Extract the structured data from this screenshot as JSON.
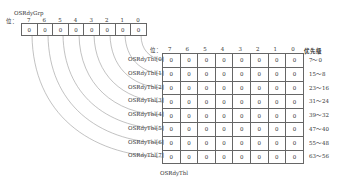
{
  "grp": {
    "title": "OSRdyGrp",
    "bit_prefix": "位：",
    "bits": [
      "7",
      "6",
      "5",
      "4",
      "3",
      "2",
      "1",
      "0"
    ],
    "values": [
      "0",
      "0",
      "0",
      "0",
      "0",
      "0",
      "0",
      "0"
    ]
  },
  "tbl": {
    "caption": "OSRdyTbl",
    "bit_prefix": "位：",
    "bits": [
      "7",
      "6",
      "5",
      "4",
      "3",
      "2",
      "1",
      "0"
    ],
    "priority_header": "优先级",
    "rows": [
      {
        "label": "OSRdyTbl[0]",
        "values": [
          "0",
          "0",
          "0",
          "0",
          "0",
          "0",
          "0",
          "0"
        ],
        "priority": "7～0"
      },
      {
        "label": "OSRdyTbl[1]",
        "values": [
          "0",
          "0",
          "0",
          "0",
          "0",
          "0",
          "0",
          "0"
        ],
        "priority": "15～8"
      },
      {
        "label": "OSRdyTbl[2]",
        "values": [
          "0",
          "0",
          "0",
          "0",
          "0",
          "0",
          "0",
          "0"
        ],
        "priority": "23～16"
      },
      {
        "label": "OSRdyTbl[3]",
        "values": [
          "0",
          "0",
          "0",
          "0",
          "0",
          "0",
          "0",
          "0"
        ],
        "priority": "31～24"
      },
      {
        "label": "OSRdyTbl[4]",
        "values": [
          "0",
          "0",
          "0",
          "0",
          "0",
          "0",
          "0",
          "0"
        ],
        "priority": "39～32"
      },
      {
        "label": "OSRdyTbl[5]",
        "values": [
          "0",
          "0",
          "0",
          "0",
          "0",
          "0",
          "0",
          "0"
        ],
        "priority": "47～40"
      },
      {
        "label": "OSRdyTbl[6]",
        "values": [
          "0",
          "0",
          "0",
          "0",
          "0",
          "0",
          "0",
          "0"
        ],
        "priority": "55～48"
      },
      {
        "label": "OSRdyTbl[7]",
        "values": [
          "0",
          "0",
          "0",
          "0",
          "0",
          "0",
          "0",
          "0"
        ],
        "priority": "63～56"
      }
    ]
  }
}
